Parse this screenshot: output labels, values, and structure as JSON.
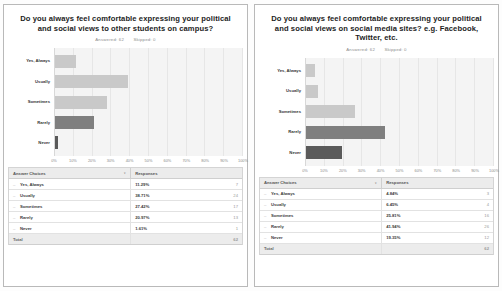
{
  "panels": [
    {
      "title": "Do you always feel comfortable expressing your political and social views to other students on campus?",
      "answered_label": "Answered: 62",
      "skipped_label": "Skipped: 0",
      "table": {
        "col_choice": "Answer Choices",
        "col_responses": "Responses",
        "total_label": "Total",
        "total_value": "62",
        "rows": [
          {
            "choice": "Yes, Always",
            "pct": "11.29%",
            "count": "7"
          },
          {
            "choice": "Usually",
            "pct": "38.71%",
            "count": "24"
          },
          {
            "choice": "Sometimes",
            "pct": "27.42%",
            "count": "17"
          },
          {
            "choice": "Rarely",
            "pct": "20.97%",
            "count": "13"
          },
          {
            "choice": "Never",
            "pct": "1.61%",
            "count": "1"
          }
        ]
      }
    },
    {
      "title": "Do you always feel comfortable expressing your political and social views on social media sites? e.g. Facebook, Twitter, etc.",
      "answered_label": "Answered: 62",
      "skipped_label": "Skipped: 0",
      "table": {
        "col_choice": "Answer Choices",
        "col_responses": "Responses",
        "total_label": "Total",
        "total_value": "62",
        "rows": [
          {
            "choice": "Yes, Always",
            "pct": "4.84%",
            "count": "3"
          },
          {
            "choice": "Usually",
            "pct": "6.45%",
            "count": "4"
          },
          {
            "choice": "Sometimes",
            "pct": "25.81%",
            "count": "16"
          },
          {
            "choice": "Rarely",
            "pct": "41.94%",
            "count": "26"
          },
          {
            "choice": "Never",
            "pct": "19.35%",
            "count": "12"
          }
        ]
      }
    }
  ],
  "chart_data": [
    {
      "type": "bar",
      "orientation": "horizontal",
      "title": "Do you always feel comfortable expressing your political and social views to other students on campus?",
      "categories": [
        "Yes, Always",
        "Usually",
        "Sometimes",
        "Rarely",
        "Never"
      ],
      "values": [
        11.29,
        38.71,
        27.42,
        20.97,
        1.61
      ],
      "counts": [
        7,
        24,
        17,
        13,
        1
      ],
      "colors": [
        "#c9c9c9",
        "#c9c9c9",
        "#c9c9c9",
        "#7f7f7f",
        "#5a5a5a"
      ],
      "xlabel": "",
      "ylabel": "",
      "xlim": [
        0,
        100
      ],
      "xticks": [
        "0%",
        "10%",
        "20%",
        "30%",
        "40%",
        "50%",
        "60%",
        "70%",
        "80%",
        "90%",
        "100%"
      ],
      "grid": true,
      "legend": "none"
    },
    {
      "type": "bar",
      "orientation": "horizontal",
      "title": "Do you always feel comfortable expressing your political and social views on social media sites? e.g. Facebook, Twitter, etc.",
      "categories": [
        "Yes, Always",
        "Usually",
        "Sometimes",
        "Rarely",
        "Never"
      ],
      "values": [
        4.84,
        6.45,
        25.81,
        41.94,
        19.35
      ],
      "counts": [
        3,
        4,
        16,
        26,
        12
      ],
      "colors": [
        "#c9c9c9",
        "#c9c9c9",
        "#c9c9c9",
        "#7f7f7f",
        "#5a5a5a"
      ],
      "xlabel": "",
      "ylabel": "",
      "xlim": [
        0,
        100
      ],
      "xticks": [
        "0%",
        "10%",
        "20%",
        "30%",
        "40%",
        "50%",
        "60%",
        "70%",
        "80%",
        "90%",
        "100%"
      ],
      "grid": true,
      "legend": "none"
    }
  ]
}
